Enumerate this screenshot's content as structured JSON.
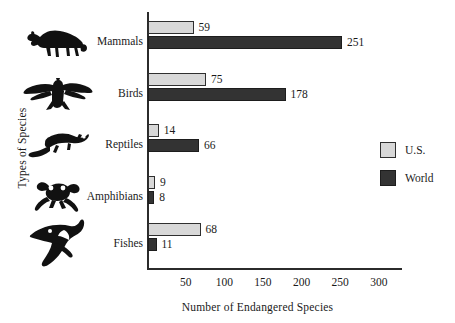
{
  "chart_data": {
    "type": "bar",
    "orientation": "horizontal",
    "title": "",
    "xlabel": "Number of Endangered Species",
    "ylabel": "Types of Species",
    "categories": [
      "Mammals",
      "Birds",
      "Reptiles",
      "Amphibians",
      "Fishes"
    ],
    "series": [
      {
        "name": "U.S.",
        "color": "#d8d8d8",
        "values": [
          59,
          75,
          14,
          9,
          68
        ]
      },
      {
        "name": "World",
        "color": "#333333",
        "values": [
          251,
          178,
          66,
          8,
          11
        ]
      }
    ],
    "xlim": [
      0,
      330
    ],
    "xticks": [
      50,
      100,
      150,
      200,
      250,
      300
    ],
    "xtick_labels": [
      "50",
      "100",
      "150",
      "200",
      "250",
      "300"
    ],
    "grid": false,
    "legend_position": "right",
    "value_labels": {
      "mammals_us": "59",
      "mammals_world": "251",
      "birds_us": "75",
      "birds_world": "178",
      "reptiles_us": "14",
      "reptiles_world": "66",
      "amphibians_us": "9",
      "amphibians_world": "8",
      "fishes_us": "68",
      "fishes_world": "11"
    },
    "icons": [
      "armadillo-icon",
      "eagle-icon",
      "lizard-icon",
      "frog-icon",
      "shark-icon"
    ]
  },
  "legend": {
    "items": [
      {
        "label": "U.S."
      },
      {
        "label": "World"
      }
    ]
  }
}
